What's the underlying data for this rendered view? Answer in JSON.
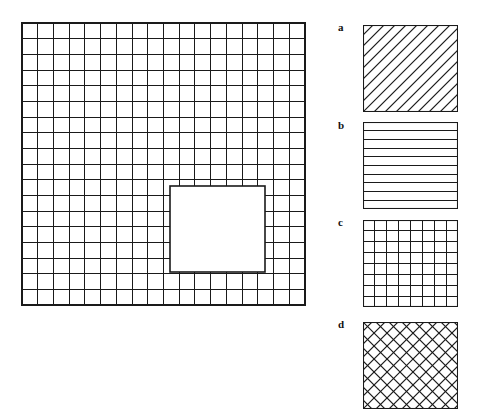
{
  "figure": {
    "background_color": "#ffffff",
    "line_color": "#1a1a1a",
    "width": 480,
    "height": 413
  },
  "main_grid": {
    "name": "main-grid",
    "x": 22,
    "y": 23,
    "width": 283,
    "height": 282,
    "columns": 18,
    "rows": 18,
    "cell_width": 15.72,
    "cell_height": 15.67,
    "border_width": 1.6,
    "grid_line_width": 1.0,
    "hole": {
      "name": "inner-white-square",
      "x": 170,
      "y": 186,
      "width": 95,
      "height": 86,
      "col_start": 9.4,
      "col_end": 15.5,
      "row_start": 10.4,
      "row_end": 15.9,
      "fill": "#ffffff"
    }
  },
  "legend": {
    "name": "pattern-key",
    "swatch_width": 95,
    "swatch_height": 87,
    "items": [
      {
        "key": "a",
        "label": "a",
        "pattern": "diagonal-hatch-up",
        "description": "parallel 45 degree lines running from lower-left to upper-right",
        "line_count": 12,
        "spacing": 11,
        "top": 25,
        "label_top": 22
      },
      {
        "key": "b",
        "label": "b",
        "pattern": "horizontal-lines",
        "description": "parallel horizontal lines",
        "line_count": 9,
        "spacing": 9.6,
        "top": 122,
        "label_top": 120
      },
      {
        "key": "c",
        "label": "c",
        "pattern": "square-grid",
        "description": "orthogonal crosshatch of horizontal and vertical lines",
        "line_count": 7,
        "spacing": 13.6,
        "top": 220,
        "label_top": 217
      },
      {
        "key": "d",
        "label": "d",
        "pattern": "diagonal-crosshatch",
        "description": "45 degree lines crossing in both directions forming diamonds",
        "line_count": 11,
        "spacing": 13,
        "top": 322,
        "label_top": 319
      }
    ]
  }
}
